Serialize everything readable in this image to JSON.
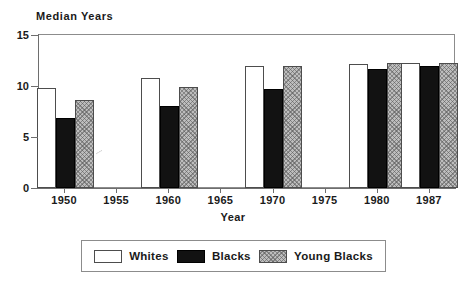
{
  "chart_data": {
    "type": "bar",
    "title": "",
    "ylabel": "Median Years",
    "xlabel": "Year",
    "ylim": [
      0,
      15
    ],
    "yticks": [
      0,
      5,
      10,
      15
    ],
    "ytick_labels": [
      "0",
      "5",
      "10",
      "15"
    ],
    "grid": false,
    "legend_position": "bottom",
    "axis_tick_years": [
      "1950",
      "1955",
      "1960",
      "1965",
      "1970",
      "1975",
      "1980",
      "1987"
    ],
    "categories": [
      "1950",
      "1960",
      "1970",
      "1980",
      "1987"
    ],
    "series": [
      {
        "name": "Whites",
        "color": "#ffffff",
        "fill": "solid-white",
        "values": [
          9.8,
          10.8,
          12.0,
          12.2,
          12.3
        ]
      },
      {
        "name": "Blacks",
        "color": "#121212",
        "fill": "solid-black",
        "values": [
          6.9,
          8.0,
          9.7,
          11.7,
          12.0
        ]
      },
      {
        "name": "Young Blacks",
        "color": "#bdbdbd",
        "fill": "gray-crosshatch",
        "values": [
          8.6,
          9.9,
          12.0,
          12.3,
          12.3
        ]
      }
    ]
  },
  "legend": {
    "items": [
      {
        "label": "Whites"
      },
      {
        "label": "Blacks"
      },
      {
        "label": "Young Blacks"
      }
    ]
  }
}
